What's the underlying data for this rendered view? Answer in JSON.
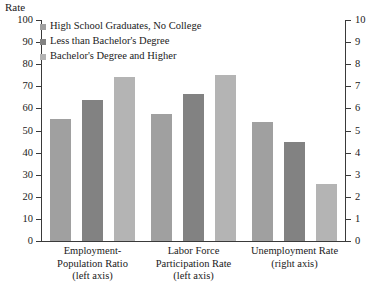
{
  "chart_data": {
    "type": "bar",
    "title": "",
    "subtitle": "",
    "ylabel": "Rate",
    "xlabel": "",
    "grid": false,
    "legend_position": "top-left",
    "categories": [
      "Employment-\nPopulation Ratio\n(left axis)",
      "Labor Force\nParticipation Rate\n(left axis)",
      "Unemployment Rate\n(right axis)"
    ],
    "category_lines": [
      [
        "Employment-",
        "Population Ratio",
        "(left axis)"
      ],
      [
        "Labor Force",
        "Participation Rate",
        "(left axis)"
      ],
      [
        "Unemployment Rate",
        "(right axis)"
      ]
    ],
    "category_axis": [
      "left",
      "left",
      "right"
    ],
    "series": [
      {
        "name": "High School Graduates, No College",
        "color": "#a0a0a0",
        "values": [
          55,
          57.5,
          5.4
        ]
      },
      {
        "name": "Less than Bachelor's Degree",
        "color": "#828282",
        "values": [
          64,
          66.5,
          4.5
        ]
      },
      {
        "name": "Bachelor's Degree and Higher",
        "color": "#b4b4b4",
        "values": [
          74,
          75,
          2.6
        ]
      }
    ],
    "ylim": [
      0,
      100
    ],
    "y2lim": [
      0,
      10
    ],
    "yticks": [
      0,
      10,
      20,
      30,
      40,
      50,
      60,
      70,
      80,
      90,
      100
    ],
    "y2ticks": [
      0,
      1,
      2,
      3,
      4,
      5,
      6,
      7,
      8,
      9,
      10
    ],
    "ytick_labels": [
      "0",
      "10",
      "20",
      "30",
      "40",
      "50",
      "60",
      "70",
      "80",
      "90",
      "100"
    ],
    "y2tick_labels": [
      "0",
      "1",
      "2",
      "3",
      "4",
      "5",
      "6",
      "7",
      "8",
      "9",
      "10"
    ]
  },
  "axes": {
    "left_title": "Rate",
    "right_title": ""
  }
}
